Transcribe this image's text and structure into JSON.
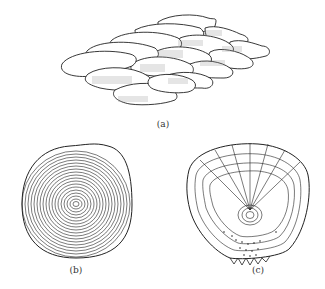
{
  "figure": {
    "panels": [
      {
        "id": "a",
        "label": "(a)",
        "description": "Overlapping lobed scales arranged in imbricate rows with hatched shading",
        "label_pos": [
          163,
          121
        ]
      },
      {
        "id": "b",
        "label": "(b)",
        "description": "Scale with concentric growth rings (circuli)",
        "label_pos": [
          76,
          267
        ]
      },
      {
        "id": "c",
        "label": "(c)",
        "description": "Scale with radiating grooves, concentric circuli and spinous posterior margin",
        "label_pos": [
          258,
          267
        ]
      }
    ],
    "colors": {
      "line": "#222222",
      "hatch": "#888888",
      "background": "#ffffff"
    }
  }
}
